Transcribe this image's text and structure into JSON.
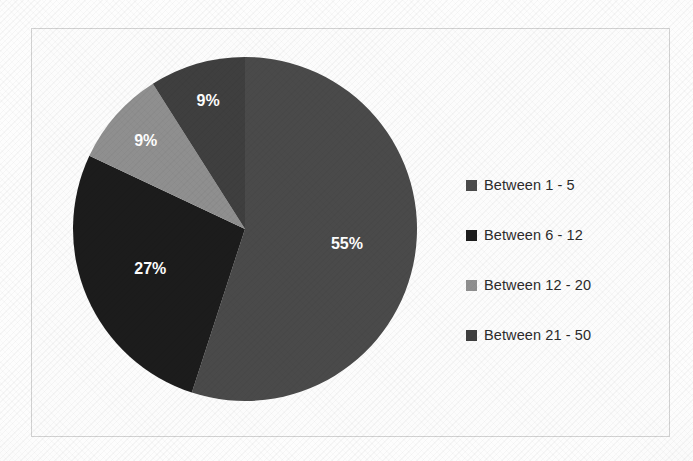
{
  "chart_data": {
    "type": "pie",
    "title": "",
    "subtitle": "",
    "xlabel": "",
    "ylabel": "",
    "grid": false,
    "legend_position": "right",
    "start_angle_deg": 0,
    "direction": "clockwise",
    "categories": [
      "Between 1 - 5",
      "Between 6 - 12",
      "Between 12 - 20",
      "Between 21 - 50"
    ],
    "values": [
      55,
      27,
      9,
      9
    ],
    "value_unit": "%",
    "data_labels": [
      "55%",
      "27%",
      "9%",
      "9%"
    ],
    "colors": [
      "#4a4a4a",
      "#1c1c1c",
      "#8f8f8f",
      "#3f3f3f"
    ],
    "slices": [
      {
        "label": "Between 1 - 5",
        "value": 55,
        "data_label": "55%",
        "color": "#4a4a4a",
        "start_deg": 0,
        "end_deg": 198
      },
      {
        "label": "Between 6 - 12",
        "value": 27,
        "data_label": "27%",
        "color": "#1c1c1c",
        "start_deg": 198,
        "end_deg": 295.2
      },
      {
        "label": "Between 12 - 20",
        "value": 9,
        "data_label": "9%",
        "color": "#8f8f8f",
        "start_deg": 295.2,
        "end_deg": 327.6
      },
      {
        "label": "Between 21 - 50",
        "value": 9,
        "data_label": "9%",
        "color": "#3f3f3f",
        "start_deg": 327.6,
        "end_deg": 360
      }
    ]
  },
  "legend": {
    "items": [
      {
        "label": "Between 1 - 5",
        "color": "#4a4a4a"
      },
      {
        "label": "Between 6 - 12",
        "color": "#1c1c1c"
      },
      {
        "label": "Between 12 - 20",
        "color": "#8f8f8f"
      },
      {
        "label": "Between 21 - 50",
        "color": "#3f3f3f"
      }
    ]
  },
  "labels": {
    "slice_1": "55%",
    "slice_2": "27%",
    "slice_3": "9%",
    "slice_4": "9%"
  }
}
